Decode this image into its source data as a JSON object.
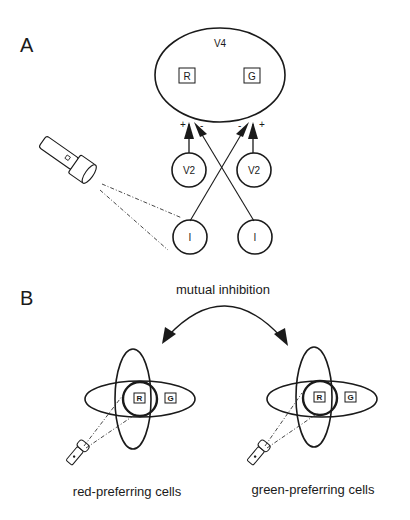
{
  "panel_a": {
    "label": "A",
    "area": {
      "name": "V4",
      "cells": [
        {
          "label": "R"
        },
        {
          "label": "G"
        }
      ]
    },
    "inputs": [
      {
        "label": "V2",
        "sign": "+"
      },
      {
        "label": "V2",
        "sign": "+"
      }
    ],
    "inhibitory": [
      {
        "label": "I",
        "sign": "-"
      },
      {
        "label": "I",
        "sign": "-"
      }
    ]
  },
  "panel_b": {
    "label": "B",
    "arrow_label": "mutual inhibition",
    "groups": [
      {
        "caption": "red-preferring cells",
        "cells": [
          {
            "label": "R"
          },
          {
            "label": "G"
          }
        ]
      },
      {
        "caption": "green-preferring cells",
        "cells": [
          {
            "label": "R"
          },
          {
            "label": "G"
          }
        ]
      }
    ]
  }
}
